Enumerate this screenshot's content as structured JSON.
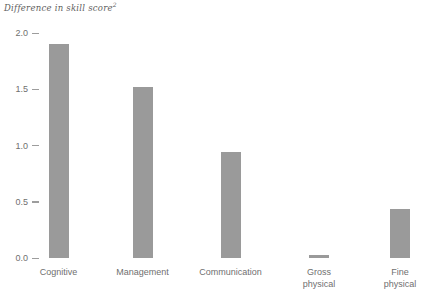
{
  "chart_data": {
    "type": "bar",
    "title": "Difference in skill score",
    "title_superscript": "2",
    "xlabel": "",
    "ylabel": "",
    "categories": [
      "Cognitive",
      "Management",
      "Communication",
      "Gross physical",
      "Fine physical"
    ],
    "category_lines": [
      [
        "Cognitive"
      ],
      [
        "Management"
      ],
      [
        "Communication"
      ],
      [
        "Gross",
        "physical"
      ],
      [
        "Fine",
        "physical"
      ]
    ],
    "values": [
      1.9,
      1.52,
      0.94,
      0.03,
      0.44
    ],
    "series": [
      {
        "name": "Difference in skill score",
        "values": [
          1.9,
          1.52,
          0.94,
          0.03,
          0.44
        ]
      }
    ],
    "ylim": [
      0.0,
      2.0
    ],
    "y_ticks": [
      0.0,
      0.5,
      1.0,
      1.5,
      2.0
    ],
    "y_tick_labels": [
      "0.0",
      "0.5",
      "1.0",
      "1.5",
      "2.0"
    ],
    "grid": false,
    "legend": false,
    "bar_color": "#9a9a9a",
    "text_color": "#6f6f6f",
    "tick_color": "#9d9d9d",
    "background_color": "#ffffff"
  }
}
